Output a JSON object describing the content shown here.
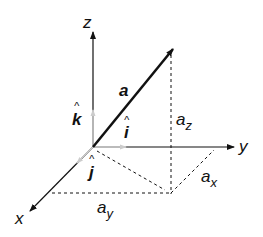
{
  "diagram": {
    "axes": {
      "z": "z",
      "y": "y",
      "x": "x"
    },
    "vector_label": "a",
    "unit_vectors": {
      "k": "k",
      "i": "i",
      "j": "j",
      "hat": "^"
    },
    "components": {
      "az_base": "a",
      "az_sub": "z",
      "ax_base": "a",
      "ax_sub": "x",
      "ay_base": "a",
      "ay_sub": "y"
    }
  }
}
